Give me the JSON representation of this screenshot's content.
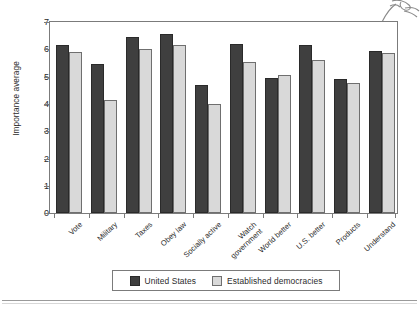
{
  "chart_data": {
    "type": "bar",
    "title": "",
    "xlabel": "",
    "ylabel": "Importance average",
    "ylim": [
      0,
      7
    ],
    "yticks": [
      0,
      1,
      2,
      3,
      4,
      5,
      6,
      7
    ],
    "grid": false,
    "legend_position": "bottom",
    "categories": [
      "Vote",
      "Military",
      "Taxes",
      "Obey law",
      "Socially active",
      "Watch government",
      "World better",
      "U.S. better",
      "Products",
      "Understand"
    ],
    "series": [
      {
        "name": "United States",
        "color": "#3f3f3f",
        "values": [
          6.15,
          5.45,
          6.45,
          6.55,
          4.7,
          6.2,
          4.95,
          6.15,
          4.9,
          5.95
        ]
      },
      {
        "name": "Established democracies",
        "color": "#d9d9d9",
        "values": [
          5.9,
          4.15,
          6.0,
          6.15,
          4.0,
          5.55,
          5.05,
          5.6,
          4.75,
          5.85
        ]
      }
    ]
  },
  "axis": {
    "y_title": "Importance average",
    "y_tick_labels": [
      "7",
      "6",
      "5",
      "4",
      "3",
      "2",
      "1",
      "0"
    ],
    "x_tick_labels": [
      "Vote",
      "Military",
      "Taxes",
      "Obey law",
      "Socially active",
      "Watch government",
      "World better",
      "U.S. better",
      "Products",
      "Understand"
    ]
  },
  "legend": {
    "entries": [
      {
        "label": "United States",
        "swatch": "#3f3f3f"
      },
      {
        "label": "Established democracies",
        "swatch": "#d9d9d9"
      }
    ]
  }
}
